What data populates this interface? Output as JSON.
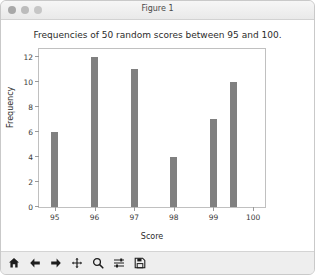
{
  "window": {
    "title": "Figure 1",
    "controls": [
      {
        "name": "close-button",
        "color": "#a8a8a8"
      },
      {
        "name": "minimize-button",
        "color": "#bcbcbc"
      },
      {
        "name": "zoom-button",
        "color": "#c6c6c6"
      }
    ]
  },
  "chart_data": {
    "type": "bar",
    "title": "Frequencies of 50 random scores between 95 and 100.",
    "xlabel": "Score",
    "ylabel": "Frequency",
    "categories": [
      95,
      96,
      97,
      98,
      99,
      99.5
    ],
    "values": [
      6,
      12,
      11,
      4,
      7,
      10
    ],
    "x": [
      95,
      96,
      97,
      98,
      99,
      99.5
    ],
    "xlim": [
      94.6,
      100.3
    ],
    "ylim": [
      0,
      12.6
    ],
    "xticks": [
      95,
      96,
      97,
      98,
      99,
      100
    ],
    "xtick_labels": [
      "95",
      "96",
      "97",
      "98",
      "99",
      "100"
    ],
    "yticks": [
      0,
      2,
      4,
      6,
      8,
      10,
      12
    ],
    "ytick_labels": [
      "0",
      "2",
      "4",
      "6",
      "8",
      "10",
      "12"
    ],
    "grid": false,
    "legend": null,
    "bar_color": "#808080",
    "bar_width": 0.18
  },
  "toolbar": {
    "buttons": [
      {
        "name": "home-icon",
        "label": "Home"
      },
      {
        "name": "back-arrow-icon",
        "label": "Back"
      },
      {
        "name": "forward-arrow-icon",
        "label": "Forward"
      },
      {
        "name": "pan-move-icon",
        "label": "Pan"
      },
      {
        "name": "zoom-magnifier-icon",
        "label": "Zoom"
      },
      {
        "name": "configure-subplots-icon",
        "label": "Configure subplots"
      },
      {
        "name": "save-floppy-icon",
        "label": "Save"
      }
    ]
  }
}
